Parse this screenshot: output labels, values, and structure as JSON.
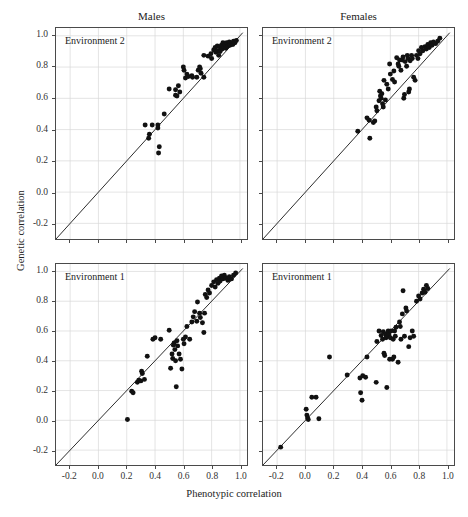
{
  "figure": {
    "x_axis_title": "Phenotypic correlation",
    "y_axis_title": "Genetic correlation",
    "column_titles": [
      "Males",
      "Females"
    ],
    "colors": {
      "point": "#111111",
      "line": "#2b2b2b",
      "grid": "#d8d8d8",
      "axis": "#4a4a4a",
      "background": "#ffffff"
    }
  },
  "axis": {
    "x_ticks": [
      "-0.2",
      "0.0",
      "0.2",
      "0.4",
      "0.6",
      "0.8",
      "1.0"
    ],
    "y_ticks": [
      "1.0",
      "0.8",
      "0.6",
      "0.4",
      "0.2",
      "0.0",
      "-0.2"
    ],
    "xlim": [
      -0.3,
      1.05
    ],
    "ylim": [
      -0.3,
      1.05
    ]
  },
  "chart_data": [
    {
      "type": "scatter",
      "panel": "males-env2",
      "title": "Males",
      "annotation": "Environment 2",
      "xlabel": "Phenotypic correlation",
      "ylabel": "Genetic correlation",
      "xlim": [
        -0.3,
        1.05
      ],
      "ylim": [
        -0.3,
        1.05
      ],
      "grid": true,
      "reference_line": {
        "type": "identity",
        "from": [
          -0.3,
          -0.3
        ],
        "to": [
          1.02,
          1.02
        ]
      },
      "points": [
        [
          0.33,
          0.43
        ],
        [
          0.38,
          0.43
        ],
        [
          0.42,
          0.43
        ],
        [
          0.42,
          0.41
        ],
        [
          0.36,
          0.37
        ],
        [
          0.355,
          0.345
        ],
        [
          0.43,
          0.29
        ],
        [
          0.425,
          0.25
        ],
        [
          0.465,
          0.5
        ],
        [
          0.5,
          0.66
        ],
        [
          0.545,
          0.655
        ],
        [
          0.545,
          0.62
        ],
        [
          0.555,
          0.615
        ],
        [
          0.565,
          0.68
        ],
        [
          0.575,
          0.64
        ],
        [
          0.6,
          0.8
        ],
        [
          0.605,
          0.78
        ],
        [
          0.615,
          0.73
        ],
        [
          0.625,
          0.755
        ],
        [
          0.635,
          0.74
        ],
        [
          0.66,
          0.745
        ],
        [
          0.665,
          0.735
        ],
        [
          0.695,
          0.735
        ],
        [
          0.705,
          0.78
        ],
        [
          0.715,
          0.8
        ],
        [
          0.72,
          0.79
        ],
        [
          0.725,
          0.76
        ],
        [
          0.745,
          0.735
        ],
        [
          0.745,
          0.875
        ],
        [
          0.775,
          0.87
        ],
        [
          0.795,
          0.885
        ],
        [
          0.8,
          0.855
        ],
        [
          0.815,
          0.91
        ],
        [
          0.825,
          0.925
        ],
        [
          0.83,
          0.895
        ],
        [
          0.84,
          0.935
        ],
        [
          0.845,
          0.905
        ],
        [
          0.85,
          0.875
        ],
        [
          0.855,
          0.93
        ],
        [
          0.86,
          0.9
        ],
        [
          0.87,
          0.94
        ],
        [
          0.875,
          0.915
        ],
        [
          0.88,
          0.955
        ],
        [
          0.885,
          0.93
        ],
        [
          0.895,
          0.945
        ],
        [
          0.9,
          0.92
        ],
        [
          0.905,
          0.955
        ],
        [
          0.915,
          0.935
        ],
        [
          0.925,
          0.96
        ],
        [
          0.93,
          0.94
        ],
        [
          0.94,
          0.955
        ],
        [
          0.95,
          0.945
        ],
        [
          0.955,
          0.965
        ],
        [
          0.965,
          0.955
        ],
        [
          0.975,
          0.97
        ]
      ]
    },
    {
      "type": "scatter",
      "panel": "females-env2",
      "title": "Females",
      "annotation": "Environment 2",
      "xlabel": "Phenotypic correlation",
      "ylabel": "Genetic correlation",
      "xlim": [
        -0.3,
        1.05
      ],
      "ylim": [
        -0.3,
        1.05
      ],
      "grid": true,
      "reference_line": {
        "type": "identity",
        "from": [
          -0.3,
          -0.3
        ],
        "to": [
          1.02,
          1.02
        ]
      },
      "points": [
        [
          0.37,
          0.39
        ],
        [
          0.435,
          0.475
        ],
        [
          0.45,
          0.46
        ],
        [
          0.455,
          0.345
        ],
        [
          0.48,
          0.445
        ],
        [
          0.49,
          0.455
        ],
        [
          0.5,
          0.545
        ],
        [
          0.505,
          0.52
        ],
        [
          0.52,
          0.585
        ],
        [
          0.525,
          0.645
        ],
        [
          0.53,
          0.615
        ],
        [
          0.535,
          0.6
        ],
        [
          0.54,
          0.63
        ],
        [
          0.545,
          0.565
        ],
        [
          0.55,
          0.545
        ],
        [
          0.555,
          0.715
        ],
        [
          0.565,
          0.59
        ],
        [
          0.575,
          0.69
        ],
        [
          0.585,
          0.66
        ],
        [
          0.595,
          0.82
        ],
        [
          0.6,
          0.755
        ],
        [
          0.615,
          0.72
        ],
        [
          0.625,
          0.775
        ],
        [
          0.63,
          0.705
        ],
        [
          0.645,
          0.86
        ],
        [
          0.655,
          0.82
        ],
        [
          0.66,
          0.805
        ],
        [
          0.665,
          0.845
        ],
        [
          0.675,
          0.78
        ],
        [
          0.685,
          0.845
        ],
        [
          0.69,
          0.865
        ],
        [
          0.695,
          0.6
        ],
        [
          0.7,
          0.625
        ],
        [
          0.705,
          0.835
        ],
        [
          0.715,
          0.805
        ],
        [
          0.72,
          0.875
        ],
        [
          0.725,
          0.855
        ],
        [
          0.73,
          0.64
        ],
        [
          0.735,
          0.66
        ],
        [
          0.74,
          0.84
        ],
        [
          0.75,
          0.875
        ],
        [
          0.755,
          0.855
        ],
        [
          0.765,
          0.735
        ],
        [
          0.775,
          0.715
        ],
        [
          0.785,
          0.875
        ],
        [
          0.795,
          0.855
        ],
        [
          0.8,
          0.905
        ],
        [
          0.81,
          0.885
        ],
        [
          0.82,
          0.925
        ],
        [
          0.83,
          0.905
        ],
        [
          0.845,
          0.93
        ],
        [
          0.855,
          0.915
        ],
        [
          0.865,
          0.945
        ],
        [
          0.875,
          0.925
        ],
        [
          0.885,
          0.955
        ],
        [
          0.895,
          0.94
        ],
        [
          0.905,
          0.96
        ],
        [
          0.92,
          0.95
        ],
        [
          0.935,
          0.965
        ],
        [
          0.95,
          0.985
        ]
      ]
    },
    {
      "type": "scatter",
      "panel": "males-env1",
      "title": "Males",
      "annotation": "Environment 1",
      "xlabel": "Phenotypic correlation",
      "ylabel": "Genetic correlation",
      "xlim": [
        -0.3,
        1.05
      ],
      "ylim": [
        -0.3,
        1.05
      ],
      "grid": true,
      "reference_line": {
        "type": "identity",
        "from": [
          -0.3,
          -0.3
        ],
        "to": [
          1.02,
          1.02
        ]
      },
      "points": [
        [
          0.205,
          0.005
        ],
        [
          0.235,
          0.195
        ],
        [
          0.245,
          0.185
        ],
        [
          0.275,
          0.255
        ],
        [
          0.285,
          0.27
        ],
        [
          0.3,
          0.265
        ],
        [
          0.305,
          0.33
        ],
        [
          0.31,
          0.315
        ],
        [
          0.325,
          0.275
        ],
        [
          0.345,
          0.43
        ],
        [
          0.385,
          0.545
        ],
        [
          0.4,
          0.555
        ],
        [
          0.44,
          0.545
        ],
        [
          0.5,
          0.605
        ],
        [
          0.51,
          0.35
        ],
        [
          0.52,
          0.445
        ],
        [
          0.525,
          0.415
        ],
        [
          0.53,
          0.505
        ],
        [
          0.535,
          0.52
        ],
        [
          0.54,
          0.475
        ],
        [
          0.545,
          0.4
        ],
        [
          0.55,
          0.225
        ],
        [
          0.555,
          0.535
        ],
        [
          0.56,
          0.5
        ],
        [
          0.57,
          0.445
        ],
        [
          0.58,
          0.41
        ],
        [
          0.59,
          0.345
        ],
        [
          0.6,
          0.545
        ],
        [
          0.605,
          0.515
        ],
        [
          0.615,
          0.56
        ],
        [
          0.625,
          0.63
        ],
        [
          0.645,
          0.545
        ],
        [
          0.66,
          0.66
        ],
        [
          0.67,
          0.695
        ],
        [
          0.68,
          0.73
        ],
        [
          0.695,
          0.665
        ],
        [
          0.7,
          0.795
        ],
        [
          0.715,
          0.72
        ],
        [
          0.72,
          0.69
        ],
        [
          0.735,
          0.655
        ],
        [
          0.745,
          0.59
        ],
        [
          0.75,
          0.72
        ],
        [
          0.755,
          0.845
        ],
        [
          0.765,
          0.825
        ],
        [
          0.775,
          0.875
        ],
        [
          0.785,
          0.855
        ],
        [
          0.8,
          0.905
        ],
        [
          0.815,
          0.93
        ],
        [
          0.825,
          0.895
        ],
        [
          0.835,
          0.945
        ],
        [
          0.845,
          0.92
        ],
        [
          0.855,
          0.955
        ],
        [
          0.86,
          0.935
        ],
        [
          0.87,
          0.97
        ],
        [
          0.88,
          0.95
        ],
        [
          0.89,
          0.975
        ],
        [
          0.9,
          0.955
        ],
        [
          0.915,
          0.94
        ],
        [
          0.925,
          0.965
        ],
        [
          0.94,
          0.95
        ],
        [
          0.955,
          0.975
        ],
        [
          0.97,
          0.99
        ]
      ]
    },
    {
      "type": "scatter",
      "panel": "females-env1",
      "title": "Females",
      "annotation": "Environment 1",
      "xlabel": "Phenotypic correlation",
      "ylabel": "Genetic correlation",
      "xlim": [
        -0.3,
        1.05
      ],
      "ylim": [
        -0.3,
        1.05
      ],
      "grid": true,
      "reference_line": {
        "type": "identity",
        "from": [
          -0.3,
          -0.3
        ],
        "to": [
          1.02,
          1.02
        ]
      },
      "points": [
        [
          -0.175,
          -0.18
        ],
        [
          0.005,
          0.075
        ],
        [
          0.01,
          0.035
        ],
        [
          0.015,
          0.015
        ],
        [
          0.02,
          0.005
        ],
        [
          0.095,
          0.01
        ],
        [
          0.045,
          0.155
        ],
        [
          0.075,
          0.155
        ],
        [
          0.17,
          0.425
        ],
        [
          0.295,
          0.305
        ],
        [
          0.385,
          0.285
        ],
        [
          0.39,
          0.185
        ],
        [
          0.4,
          0.135
        ],
        [
          0.405,
          0.3
        ],
        [
          0.425,
          0.29
        ],
        [
          0.435,
          0.425
        ],
        [
          0.5,
          0.255
        ],
        [
          0.505,
          0.53
        ],
        [
          0.52,
          0.6
        ],
        [
          0.535,
          0.57
        ],
        [
          0.545,
          0.545
        ],
        [
          0.55,
          0.595
        ],
        [
          0.555,
          0.45
        ],
        [
          0.56,
          0.435
        ],
        [
          0.565,
          0.58
        ],
        [
          0.57,
          0.555
        ],
        [
          0.575,
          0.22
        ],
        [
          0.58,
          0.565
        ],
        [
          0.585,
          0.6
        ],
        [
          0.59,
          0.575
        ],
        [
          0.595,
          0.41
        ],
        [
          0.6,
          0.555
        ],
        [
          0.605,
          0.6
        ],
        [
          0.615,
          0.41
        ],
        [
          0.62,
          0.545
        ],
        [
          0.625,
          0.425
        ],
        [
          0.63,
          0.6
        ],
        [
          0.635,
          0.565
        ],
        [
          0.64,
          0.625
        ],
        [
          0.655,
          0.39
        ],
        [
          0.665,
          0.66
        ],
        [
          0.67,
          0.63
        ],
        [
          0.675,
          0.545
        ],
        [
          0.685,
          0.715
        ],
        [
          0.69,
          0.87
        ],
        [
          0.7,
          0.565
        ],
        [
          0.71,
          0.755
        ],
        [
          0.715,
          0.735
        ],
        [
          0.73,
          0.495
        ],
        [
          0.74,
          0.555
        ],
        [
          0.755,
          0.6
        ],
        [
          0.765,
          0.565
        ],
        [
          0.785,
          0.8
        ],
        [
          0.8,
          0.835
        ],
        [
          0.81,
          0.815
        ],
        [
          0.825,
          0.855
        ],
        [
          0.835,
          0.88
        ],
        [
          0.845,
          0.86
        ],
        [
          0.855,
          0.905
        ],
        [
          0.865,
          0.885
        ]
      ]
    }
  ]
}
